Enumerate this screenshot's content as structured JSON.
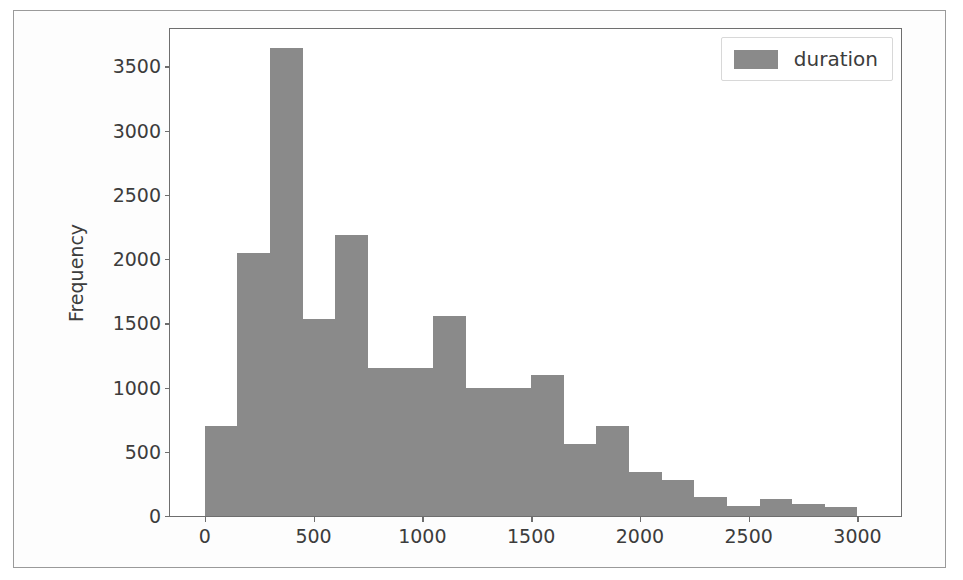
{
  "figure": {
    "background_color": "#ffffff",
    "frame_color": "#9a9a9a",
    "axes_color": "#6e6e6e"
  },
  "legend": {
    "position": "upper right",
    "swatch_color": "#8a8a8a",
    "entries": [
      {
        "label": "duration",
        "color": "#8a8a8a"
      }
    ]
  },
  "caption": {
    "text": ""
  },
  "chart_data": {
    "type": "bar",
    "title": "",
    "subtitle": "",
    "xlabel": "",
    "ylabel": "Frequency",
    "grid": false,
    "legend_position": "upper right",
    "bar_color": "#8a8a8a",
    "xlim": [
      -160,
      3200
    ],
    "ylim": [
      0,
      3790
    ],
    "xticks": [
      0,
      500,
      1000,
      1500,
      2000,
      2500,
      3000
    ],
    "xtick_labels": [
      "0",
      "500",
      "1000",
      "1500",
      "2000",
      "2500",
      "3000"
    ],
    "yticks": [
      0,
      500,
      1000,
      1500,
      2000,
      2500,
      3000,
      3500
    ],
    "ytick_labels": [
      "0",
      "500",
      "1000",
      "1500",
      "2000",
      "2500",
      "3000",
      "3500"
    ],
    "bin_width": 150,
    "bin_edges": [
      0,
      150,
      300,
      450,
      600,
      750,
      900,
      1050,
      1200,
      1350,
      1500,
      1650,
      1800,
      1950,
      2100,
      2250,
      2400,
      2550,
      2700,
      2850,
      3000
    ],
    "categories": [
      "0-150",
      "150-300",
      "300-450",
      "450-600",
      "600-750",
      "750-900",
      "900-1050",
      "1050-1200",
      "1200-1350",
      "1350-1500",
      "1500-1650",
      "1650-1800",
      "1800-1950",
      "1950-2100",
      "2100-2250",
      "2250-2400",
      "2400-2550",
      "2550-2700",
      "2700-2850",
      "2850-3000"
    ],
    "series": [
      {
        "name": "duration",
        "values": [
          700,
          2050,
          3640,
          1530,
          2190,
          1150,
          1150,
          1560,
          1000,
          1000,
          1100,
          560,
          700,
          340,
          280,
          150,
          75,
          130,
          90,
          70
        ]
      }
    ]
  }
}
